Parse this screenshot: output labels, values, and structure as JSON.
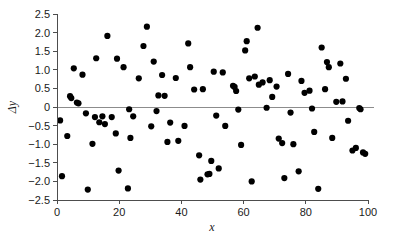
{
  "chart_data": {
    "type": "scatter",
    "title": "",
    "xlabel": "x",
    "ylabel": "Δy",
    "xlim": [
      0,
      100
    ],
    "ylim": [
      -2.5,
      2.5
    ],
    "grid": false,
    "legend": null,
    "xticks": [
      "0",
      "20",
      "40",
      "60",
      "80",
      "100"
    ],
    "xtick_values": [
      0,
      20,
      40,
      60,
      80,
      100
    ],
    "yticks": [
      "2.5",
      "2.0",
      "1.5",
      "1.0",
      "0.5",
      "0",
      "−0.5",
      "−1.0",
      "−1.5",
      "−2.0",
      "−2.5"
    ],
    "ytick_values": [
      2.5,
      2.0,
      1.5,
      1.0,
      0.5,
      0,
      -0.5,
      -1.0,
      -1.5,
      -2.0,
      -2.5
    ],
    "reference_line": {
      "y": 0,
      "color": "#8c8c8c"
    },
    "marker": {
      "shape": "circle",
      "color": "#000000",
      "size": 3.1
    },
    "points": [
      [
        1.0,
        -0.36
      ],
      [
        1.6,
        -1.86
      ],
      [
        3.3,
        -0.78
      ],
      [
        4.2,
        0.29
      ],
      [
        4.6,
        0.24
      ],
      [
        5.4,
        1.04
      ],
      [
        6.4,
        0.12
      ],
      [
        6.9,
        0.1
      ],
      [
        8.2,
        0.87
      ],
      [
        9.3,
        -0.17
      ],
      [
        9.9,
        -2.22
      ],
      [
        11.4,
        -0.99
      ],
      [
        12.2,
        -0.27
      ],
      [
        12.6,
        1.31
      ],
      [
        13.6,
        -0.41
      ],
      [
        14.6,
        -0.25
      ],
      [
        15.4,
        -0.46
      ],
      [
        16.2,
        1.91
      ],
      [
        17.6,
        -0.27
      ],
      [
        18.9,
        -0.71
      ],
      [
        19.3,
        1.3
      ],
      [
        19.8,
        -1.71
      ],
      [
        21.4,
        1.07
      ],
      [
        22.8,
        -2.19
      ],
      [
        23.2,
        -0.06
      ],
      [
        23.6,
        -0.83
      ],
      [
        24.5,
        -0.25
      ],
      [
        26.3,
        0.77
      ],
      [
        27.8,
        1.64
      ],
      [
        28.9,
        2.16
      ],
      [
        30.3,
        -0.52
      ],
      [
        31.1,
        1.22
      ],
      [
        32.0,
        -0.11
      ],
      [
        32.6,
        0.31
      ],
      [
        33.8,
        0.86
      ],
      [
        34.6,
        0.3
      ],
      [
        35.5,
        -0.94
      ],
      [
        36.4,
        -0.42
      ],
      [
        38.2,
        0.78
      ],
      [
        39.0,
        -0.91
      ],
      [
        41.0,
        -0.51
      ],
      [
        42.2,
        1.71
      ],
      [
        42.8,
        1.07
      ],
      [
        44.1,
        0.47
      ],
      [
        45.7,
        -1.3
      ],
      [
        46.1,
        -1.95
      ],
      [
        46.9,
        0.48
      ],
      [
        48.4,
        -1.81
      ],
      [
        49.0,
        -1.8
      ],
      [
        49.6,
        -1.45
      ],
      [
        50.4,
        0.95
      ],
      [
        51.2,
        -0.23
      ],
      [
        52.0,
        -1.65
      ],
      [
        53.3,
        0.93
      ],
      [
        54.1,
        -0.51
      ],
      [
        56.6,
        0.57
      ],
      [
        57.1,
        0.54
      ],
      [
        57.6,
        0.43
      ],
      [
        58.3,
        -0.07
      ],
      [
        59.2,
        -1.02
      ],
      [
        60.5,
        1.52
      ],
      [
        61.0,
        1.77
      ],
      [
        61.8,
        0.77
      ],
      [
        62.6,
        -2.0
      ],
      [
        63.6,
        0.82
      ],
      [
        64.5,
        2.13
      ],
      [
        64.9,
        0.6
      ],
      [
        66.1,
        0.66
      ],
      [
        67.4,
        -0.02
      ],
      [
        68.4,
        0.72
      ],
      [
        69.2,
        0.27
      ],
      [
        70.6,
        0.55
      ],
      [
        71.3,
        -0.85
      ],
      [
        72.4,
        -0.97
      ],
      [
        73.1,
        -1.91
      ],
      [
        74.3,
        0.89
      ],
      [
        75.1,
        -0.15
      ],
      [
        76.0,
        -1.0
      ],
      [
        77.7,
        -1.73
      ],
      [
        78.6,
        0.7
      ],
      [
        79.6,
        0.38
      ],
      [
        81.2,
        0.44
      ],
      [
        82.0,
        -0.04
      ],
      [
        82.7,
        -0.67
      ],
      [
        84.0,
        -2.2
      ],
      [
        85.1,
        1.6
      ],
      [
        86.2,
        0.48
      ],
      [
        86.8,
        1.21
      ],
      [
        87.4,
        1.07
      ],
      [
        88.5,
        -0.83
      ],
      [
        89.8,
        0.14
      ],
      [
        91.1,
        1.17
      ],
      [
        91.8,
        0.15
      ],
      [
        92.9,
        0.76
      ],
      [
        93.6,
        -0.37
      ],
      [
        95.0,
        -1.17
      ],
      [
        96.1,
        -1.1
      ],
      [
        97.2,
        -0.03
      ],
      [
        97.6,
        -0.06
      ],
      [
        98.4,
        -1.22
      ],
      [
        99.1,
        -1.26
      ]
    ]
  },
  "axes": {
    "y_axis_title": "Δy",
    "x_axis_title": "x"
  }
}
